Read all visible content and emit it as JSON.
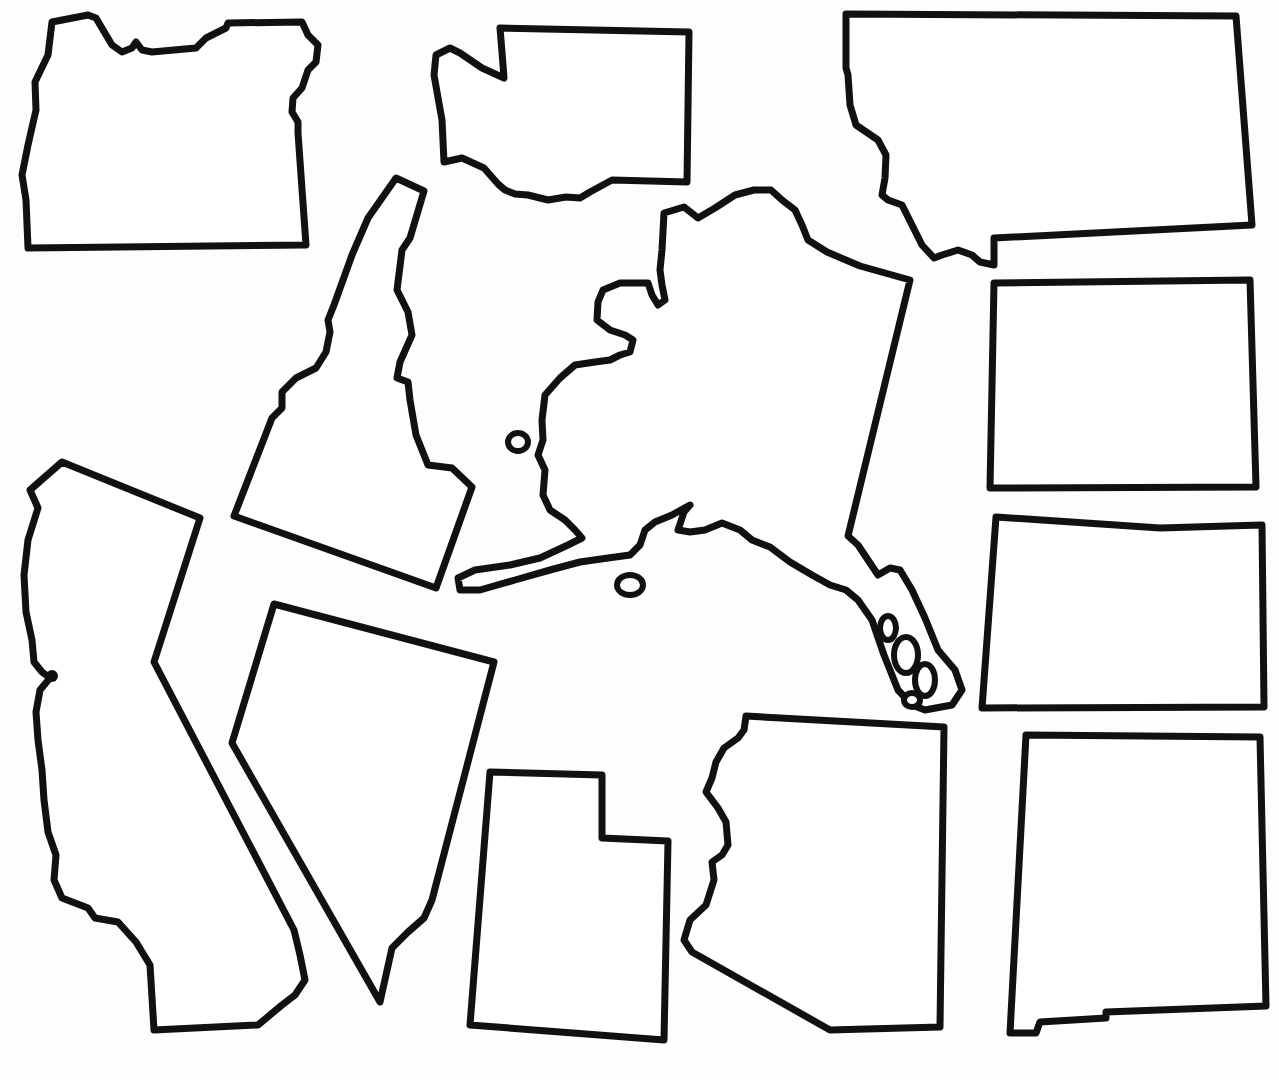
{
  "page": {
    "background": "#fdfdfd",
    "stroke_color": "#111111"
  },
  "states": [
    {
      "id": "oregon",
      "name": "Oregon",
      "path": "M52,22 L88,15 L96,18 L112,45 L122,52 L132,48 L136,42 L142,50 L152,52 L196,48 L206,38 L226,28 L228,23 L302,22 L308,35 L318,45 L316,62 L308,70 L302,88 L293,98 L292,112 L298,122 L298,133 L306,245 L28,248 L26,200 L22,175 L28,145 L36,110 L35,82 L48,55 Z"
    },
    {
      "id": "washington",
      "name": "Washington",
      "path": "M500,28 L689,32 L687,182 L612,180 L590,192 L580,198 L566,197 L548,200 L528,195 L515,194 L505,190 L498,184 L484,168 L462,158 L444,162 L442,120 L434,75 L436,55 L450,48 L460,53 L482,68 L504,78 L502,52 Z"
    },
    {
      "id": "montana",
      "name": "Montana",
      "path": "M846,14 L1236,16 L1252,225 L994,238 L994,265 L980,262 L972,255 L958,250 L942,255 L934,258 L922,245 L912,225 L902,205 L888,200 L882,195 L885,178 L886,155 L878,140 L856,125 L850,105 L848,75 L846,68 Z"
    },
    {
      "id": "idaho",
      "name": "Idaho",
      "path": "M396,178 L424,191 L410,238 L402,250 L397,290 L408,312 L412,335 L400,362 L397,378 L408,382 L410,400 L416,435 L428,465 L452,468 L472,487 L436,588 L234,516 L272,418 L282,408 L282,392 L296,378 L316,368 L326,352 L330,332 L328,320 L334,305 L352,255 L368,218 Z"
    },
    {
      "id": "california",
      "name": "California",
      "path": "M62,462 L200,518 L154,662 L294,930 L300,955 L305,980 L295,995 L282,1005 L258,1025 L154,1030 L150,965 L136,942 L118,922 L95,918 L88,908 L62,898 L54,880 L56,855 L48,832 L44,800 L42,770 L38,740 L36,712 L40,690 L50,678 L42,672 L34,662 L32,640 L26,612 L24,575 L28,540 L38,508 L30,490 Z"
    },
    {
      "id": "nevada",
      "name": "Nevada",
      "path": "M274,604 L494,662 L432,900 L424,918 L408,932 L392,948 L380,1002 L232,743 Z"
    },
    {
      "id": "utah",
      "name": "Utah",
      "path": "M490,772 L602,775 L602,838 L668,841 L664,1040 L470,1025 Z"
    },
    {
      "id": "arizona",
      "name": "Arizona",
      "path": "M746,716 L944,727 L940,1027 L830,1030 L692,952 L684,940 L690,920 L706,905 L714,880 L712,862 L722,855 L728,845 L726,822 L718,808 L706,792 L712,778 L716,762 L724,748 L738,738 L744,730 Z"
    },
    {
      "id": "alaska",
      "name": "Alaska",
      "path": "M664,213 L684,207 L698,218 L715,208 L735,195 L754,190 L771,190 L782,200 L795,210 L802,225 L808,240 L827,252 L860,266 L910,280 L848,536 L858,545 L868,560 L878,575 L890,568 L900,570 L912,590 L925,618 L938,650 L955,670 L962,690 L952,705 L925,710 L912,705 L898,690 L884,655 L872,620 L858,600 L846,590 L830,585 L812,575 L790,562 L770,547 L752,540 L740,530 L722,523 L705,530 L690,532 L678,530 L684,512 L690,505 L672,515 L655,522 L645,530 L640,545 L630,555 L608,558 L580,562 L550,570 L515,580 L480,590 L460,590 L458,578 L475,570 L510,565 L540,558 L568,545 L582,538 L575,530 L565,520 L550,510 L543,495 L545,470 L538,455 L543,440 L542,420 L545,395 L560,378 L575,365 L595,362 L610,360 L620,355 L630,352 L633,340 L625,335 L610,330 L597,320 L598,302 L603,290 L620,283 L648,283 L652,295 L658,305 L665,300 L662,285 L660,270 L662,250 Z"
    },
    {
      "id": "wyoming",
      "name": "Wyoming",
      "path": "M994,283 L1250,280 L1256,487 L990,488 Z"
    },
    {
      "id": "colorado",
      "name": "Colorado",
      "path": "M996,517 L1160,528 L1262,525 L1264,707 L982,708 Z"
    },
    {
      "id": "new_mexico",
      "name": "New Mexico",
      "path": "M1026,735 L1260,737 L1266,1006 L1106,1012 L1106,1018 L1040,1022 L1036,1033 L1010,1033 Z"
    }
  ],
  "islands": [
    {
      "id": "st-lawrence-island",
      "name": "St. Lawrence Island",
      "cx": 518,
      "cy": 442,
      "rx": 10,
      "ry": 9
    },
    {
      "id": "kodiak-island",
      "name": "Kodiak Island",
      "cx": 630,
      "cy": 585,
      "rx": 13,
      "ry": 10
    }
  ],
  "alaska_panhandle_islands": [
    {
      "cx": 888,
      "cy": 628,
      "rx": 8,
      "ry": 12
    },
    {
      "cx": 906,
      "cy": 655,
      "rx": 12,
      "ry": 18
    },
    {
      "cx": 925,
      "cy": 680,
      "rx": 10,
      "ry": 16
    },
    {
      "cx": 912,
      "cy": 700,
      "rx": 8,
      "ry": 7
    }
  ],
  "markers": [
    {
      "id": "sf-bay-marker",
      "name": "San Francisco Bay mark",
      "cx": 52,
      "cy": 676,
      "r": 6
    }
  ]
}
